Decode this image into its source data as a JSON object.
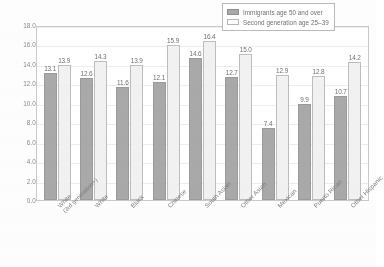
{
  "chart_data": {
    "type": "bar",
    "title": "",
    "xlabel": "",
    "ylabel": "Years of education",
    "ylim": [
      0,
      18
    ],
    "ytick_step": 2,
    "ytick_labels": [
      "0.0",
      "2.0",
      "4.0",
      "6.0",
      "8.0",
      "10.0",
      "12.0",
      "14.0",
      "16.0",
      "18.0"
    ],
    "grid": true,
    "legend_position": "top-right",
    "categories": [
      "White (3rd generation+)",
      "White",
      "Black",
      "Chinese",
      "South Asian",
      "Other Asian",
      "Mexican",
      "Puerto Rican",
      "Other Hispanic"
    ],
    "category_lines": [
      [
        "White",
        "(3rd generation+)"
      ],
      [
        "White"
      ],
      [
        "Black"
      ],
      [
        "Chinese"
      ],
      [
        "South Asian"
      ],
      [
        "Other Asian"
      ],
      [
        "Mexican"
      ],
      [
        "Puerto Rican"
      ],
      [
        "Other Hispanic"
      ]
    ],
    "series": [
      {
        "name": "Immigrants age 50 and over",
        "color": "#a9a9a9",
        "values": [
          13.1,
          12.6,
          11.6,
          12.1,
          14.6,
          12.7,
          7.4,
          9.9,
          10.7
        ]
      },
      {
        "name": "Second generation age 25–39",
        "color": "#f1f1f1",
        "values": [
          13.9,
          14.3,
          13.9,
          15.9,
          16.4,
          15.0,
          12.9,
          12.8,
          14.2
        ]
      }
    ]
  },
  "legend": {
    "items": [
      {
        "label": "Immigrants age 50 and over"
      },
      {
        "label": "Second generation age 25–39"
      }
    ]
  }
}
